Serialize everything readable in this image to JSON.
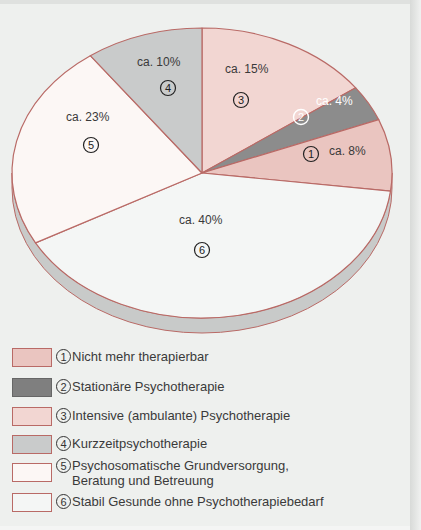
{
  "chart_data": {
    "type": "pie",
    "title": "",
    "start_angle_deg": 0,
    "direction": "clockwise",
    "slices": [
      {
        "id": 3,
        "label": "Intensive (ambulante) Psychotherapie",
        "value": 15,
        "value_label": "ca. 15%",
        "color": "#f2d6d2"
      },
      {
        "id": 2,
        "label": "Stationäre Psychotherapie",
        "value": 4,
        "value_label": "ca. 4%",
        "color": "#8c8c8c"
      },
      {
        "id": 1,
        "label": "Nicht mehr therapierbar",
        "value": 8,
        "value_label": "ca. 8%",
        "color": "#eac5c0"
      },
      {
        "id": 6,
        "label": "Stabil Gesunde ohne Psychotherapiebedarf",
        "value": 40,
        "value_label": "ca. 40%",
        "color": "#f4f6f5"
      },
      {
        "id": 5,
        "label": "Psychosomatische Grundversorgung, Beratung und Betreuung",
        "value": 23,
        "value_label": "ca. 23%",
        "color": "#fcf7f5"
      },
      {
        "id": 4,
        "label": "Kurzzeitpsychotherapie",
        "value": 10,
        "value_label": "ca. 10%",
        "color": "#c9cbcb"
      }
    ],
    "unit": "%",
    "legend_position": "bottom",
    "style": "3d-pie"
  },
  "pie_labels": {
    "s3": {
      "pct": "ca. 15%",
      "num": "3"
    },
    "s2": {
      "pct": "ca. 4%",
      "num": "2"
    },
    "s1": {
      "pct": "ca. 8%",
      "num": "1"
    },
    "s6": {
      "pct": "ca. 40%",
      "num": "6"
    },
    "s5": {
      "pct": "ca. 23%",
      "num": "5"
    },
    "s4": {
      "pct": "ca. 10%",
      "num": "4"
    }
  },
  "legend": [
    {
      "num": "1",
      "text": "Nicht mehr therapierbar",
      "color": "#eac5c0"
    },
    {
      "num": "2",
      "text": "Stationäre Psychotherapie",
      "color": "#8c8c8c"
    },
    {
      "num": "3",
      "text": "Intensive (ambulante) Psychotherapie",
      "color": "#f2d6d2"
    },
    {
      "num": "4",
      "text": "Kurzzeitpsychotherapie",
      "color": "#c9cbcb"
    },
    {
      "num": "5",
      "text": "Psychosomatische Grundversorgung,",
      "text2": "Beratung und Betreuung",
      "color": "#fcf7f5"
    },
    {
      "num": "6",
      "text": "Stabil Gesunde ohne Psychotherapiebedarf",
      "color": "#f4f6f5"
    }
  ]
}
